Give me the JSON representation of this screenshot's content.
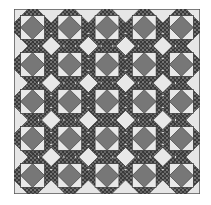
{
  "image": {
    "subject": "quilt pattern",
    "grid": {
      "rows": 5,
      "cols": 5
    },
    "colors": {
      "background": "#e6e6e6",
      "border": "#555555",
      "dark_diamond": "#777777",
      "light_diamond": "#e8e8e8",
      "print_dark": "#3a3a3a",
      "print_dot": "#bdbdbd",
      "outline": "#2a2a2a"
    }
  }
}
